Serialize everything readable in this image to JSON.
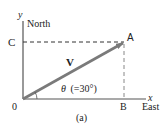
{
  "diagram": {
    "caption": "(a)",
    "axes": {
      "y_label": "y",
      "x_label": "x",
      "north_label": "North",
      "east_label": "East",
      "origin_label": "0"
    },
    "points": {
      "A": "A",
      "B": "B",
      "C": "C"
    },
    "vector": {
      "label": "V",
      "color": "#7a7a7a"
    },
    "angle": {
      "symbol": "θ",
      "text": "(=30°)",
      "value_degrees": 30
    },
    "colors": {
      "axis": "#555555",
      "dashed": "#333333",
      "vector": "#7a7a7a"
    }
  }
}
